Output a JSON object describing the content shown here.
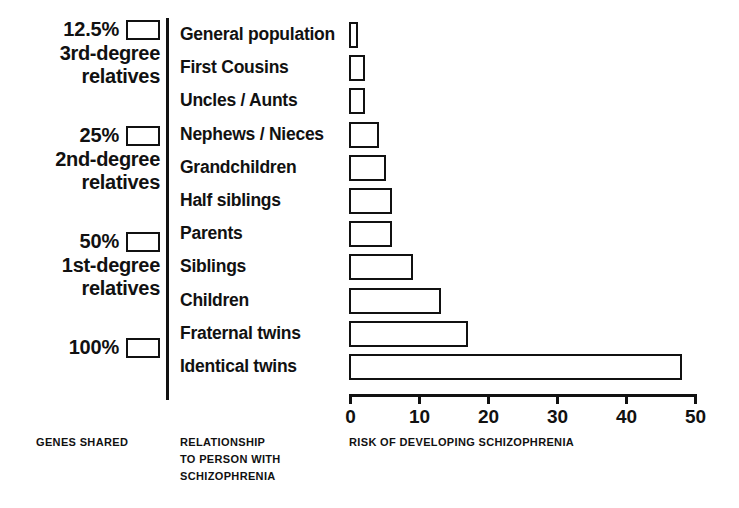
{
  "chart_data": {
    "type": "bar",
    "orientation": "horizontal",
    "title": "",
    "xlabel": "RISK OF DEVELOPING SCHIZOPHRENIA",
    "ylabel": "RELATIONSHIP TO PERSON WITH SCHIZOPHRENIA",
    "categories": [
      "General population",
      "First Cousins",
      "Uncles / Aunts",
      "Nephews / Nieces",
      "Grandchildren",
      "Half siblings",
      "Parents",
      "Siblings",
      "Children",
      "Fraternal twins",
      "Identical twins"
    ],
    "values": [
      1,
      2,
      2,
      4,
      5,
      6,
      6,
      9,
      13,
      17,
      48
    ],
    "xlim": [
      0,
      50
    ],
    "xticks": [
      0,
      10,
      20,
      30,
      40,
      50
    ],
    "xtick_labels": [
      "0",
      "10",
      "20",
      "30",
      "40",
      "50"
    ],
    "grid": false,
    "legend": null,
    "bar_fill": "#ffffff",
    "bar_edge": "#111111"
  },
  "genes_shared": {
    "caption": "GENES SHARED",
    "groups": [
      {
        "percent": "12.5%",
        "line1": "3rd-degree",
        "line2": "relatives",
        "swatch": "empty-box-swatch"
      },
      {
        "percent": "25%",
        "line1": "2nd-degree",
        "line2": "relatives",
        "swatch": "empty-box-swatch"
      },
      {
        "percent": "50%",
        "line1": "1st-degree",
        "line2": "relatives",
        "swatch": "empty-box-swatch"
      },
      {
        "percent": "100%",
        "line1": "",
        "line2": "",
        "swatch": "empty-box-swatch"
      }
    ]
  },
  "relationship": {
    "caption": "RELATIONSHIP\nTO PERSON WITH\nSCHIZOPHRENIA"
  },
  "risk": {
    "caption": "RISK OF DEVELOPING SCHIZOPHRENIA"
  },
  "colors": {
    "background": "#ffffff",
    "ink": "#111111"
  }
}
